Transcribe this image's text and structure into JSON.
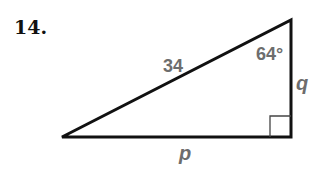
{
  "problem": {
    "number": "14."
  },
  "triangle": {
    "hypotenuse_label": "34",
    "angle_label": "64°",
    "vertical_leg_label": "q",
    "horizontal_leg_label": "p",
    "right_angle": true,
    "line_color": "#111111",
    "label_color": "#6d6d6d"
  }
}
